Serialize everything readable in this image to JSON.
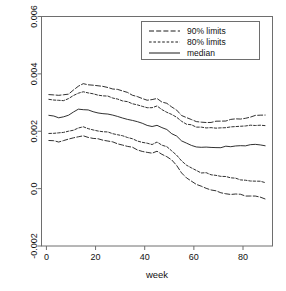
{
  "chart_data": {
    "type": "line",
    "title": "",
    "xlabel": "week",
    "ylabel": "",
    "xlim": [
      -2,
      92
    ],
    "ylim": [
      -0.002,
      0.006
    ],
    "grid": false,
    "legend_position": "top-right",
    "xticks": [
      0,
      20,
      40,
      60,
      80
    ],
    "xtick_labels": [
      "0",
      "20",
      "40",
      "60",
      "80"
    ],
    "yticks": [
      -0.002,
      0.0,
      0.002,
      0.004,
      0.006
    ],
    "ytick_labels": [
      "-0.002",
      "0.0",
      "0.002",
      "0.004",
      "0.006"
    ],
    "x": [
      1,
      3,
      5,
      7,
      9,
      11,
      13,
      15,
      17,
      19,
      21,
      23,
      25,
      27,
      29,
      31,
      33,
      35,
      37,
      39,
      41,
      43,
      45,
      47,
      49,
      51,
      53,
      55,
      57,
      59,
      61,
      63,
      65,
      67,
      69,
      71,
      73,
      75,
      77,
      79,
      81,
      83,
      85,
      87,
      89
    ],
    "series": [
      {
        "name": "90% upper limit",
        "style": "longdash",
        "values": [
          0.00329,
          0.00327,
          0.00325,
          0.00326,
          0.00331,
          0.00345,
          0.00357,
          0.00366,
          0.00362,
          0.00358,
          0.00359,
          0.00357,
          0.00352,
          0.00349,
          0.00345,
          0.0034,
          0.00334,
          0.00328,
          0.00322,
          0.00316,
          0.0031,
          0.00308,
          0.00315,
          0.00304,
          0.00296,
          0.00286,
          0.00272,
          0.00257,
          0.00246,
          0.0024,
          0.00234,
          0.00231,
          0.0023,
          0.00231,
          0.00233,
          0.00236,
          0.00238,
          0.0024,
          0.00242,
          0.00244,
          0.00247,
          0.0025,
          0.00253,
          0.00256,
          0.00258
        ]
      },
      {
        "name": "80% upper limit",
        "style": "shortdash",
        "values": [
          0.00309,
          0.00308,
          0.00307,
          0.00309,
          0.00314,
          0.00325,
          0.00333,
          0.00338,
          0.00334,
          0.0033,
          0.00328,
          0.00325,
          0.00321,
          0.00317,
          0.00313,
          0.00308,
          0.00303,
          0.00298,
          0.00292,
          0.00287,
          0.00282,
          0.0028,
          0.00286,
          0.00275,
          0.00268,
          0.00259,
          0.00247,
          0.00235,
          0.00226,
          0.0022,
          0.00215,
          0.00212,
          0.00211,
          0.00211,
          0.00212,
          0.00213,
          0.00214,
          0.00215,
          0.00216,
          0.00217,
          0.00218,
          0.00219,
          0.0022,
          0.00221,
          0.00222
        ]
      },
      {
        "name": "median",
        "style": "solid",
        "values": [
          0.00255,
          0.00252,
          0.00249,
          0.00251,
          0.00258,
          0.00268,
          0.00275,
          0.00277,
          0.00272,
          0.00267,
          0.00265,
          0.00262,
          0.00258,
          0.00254,
          0.0025,
          0.00246,
          0.00241,
          0.00236,
          0.00231,
          0.00226,
          0.00221,
          0.00218,
          0.00219,
          0.00211,
          0.00204,
          0.00194,
          0.00181,
          0.00168,
          0.00158,
          0.00152,
          0.00147,
          0.00144,
          0.00143,
          0.00143,
          0.00144,
          0.00145,
          0.00146,
          0.00147,
          0.00148,
          0.00149,
          0.0015,
          0.00151,
          0.00152,
          0.00151,
          0.00149
        ]
      },
      {
        "name": "80% lower limit",
        "style": "shortdash",
        "values": [
          0.00194,
          0.00193,
          0.00192,
          0.00194,
          0.00199,
          0.00206,
          0.00211,
          0.00213,
          0.00209,
          0.00205,
          0.00202,
          0.00199,
          0.00195,
          0.00191,
          0.00187,
          0.00183,
          0.00178,
          0.00173,
          0.00168,
          0.00163,
          0.00158,
          0.00156,
          0.00162,
          0.00153,
          0.00146,
          0.00134,
          0.00116,
          0.00097,
          0.00082,
          0.00071,
          0.00063,
          0.00057,
          0.00053,
          0.0005,
          0.00047,
          0.00044,
          0.00041,
          0.00038,
          0.00035,
          0.00032,
          0.00029,
          0.00027,
          0.00025,
          0.00024,
          0.00023
        ]
      },
      {
        "name": "90% lower limit",
        "style": "longdash",
        "values": [
          0.00166,
          0.00165,
          0.00164,
          0.00166,
          0.00171,
          0.00178,
          0.00183,
          0.00185,
          0.00181,
          0.00177,
          0.00174,
          0.00171,
          0.00166,
          0.00162,
          0.00157,
          0.00152,
          0.00147,
          0.00142,
          0.00137,
          0.00132,
          0.00127,
          0.00125,
          0.00131,
          0.00121,
          0.00113,
          0.00099,
          0.00079,
          0.00057,
          0.0004,
          0.00027,
          0.00017,
          9e-05,
          2e-05,
          -4e-05,
          -9e-05,
          -0.00013,
          -0.00016,
          -0.00018,
          -0.0002,
          -0.00022,
          -0.00024,
          -0.00026,
          -0.00028,
          -0.00031,
          -0.00034
        ]
      }
    ],
    "legend": [
      {
        "label": "90% limits",
        "style": "longdash"
      },
      {
        "label": "80% limits",
        "style": "shortdash"
      },
      {
        "label": "median",
        "style": "solid"
      }
    ]
  }
}
